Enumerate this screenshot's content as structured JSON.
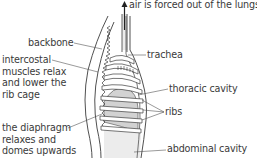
{
  "diagram": {
    "labels": {
      "air": "air is forced out of the lungs",
      "trachea": "trachea",
      "backbone": "backbone",
      "intercostal_line1": "intercostal",
      "intercostal_line2": "muscles relax",
      "intercostal_line3": "and lower the",
      "intercostal_line4": "rib cage",
      "thoracic": "thoracic cavity",
      "ribs": "ribs",
      "diaphragm_line1": "the diaphragm",
      "diaphragm_line2": "relaxes and",
      "diaphragm_line3": "domes upwards",
      "abdominal": "abdominal cavity"
    },
    "colors": {
      "line": "#3c3c3c",
      "text": "#3a3a3a",
      "fill_grey": "#d4d4d4",
      "fill_light": "#ececec",
      "background": "#ffffff"
    },
    "arrow": {
      "direction": "up",
      "meaning": "air flow out of lungs"
    }
  }
}
